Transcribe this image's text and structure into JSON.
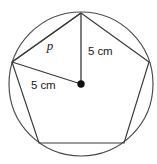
{
  "figure": {
    "background_color": "#ffffff",
    "stroke_color": "#3a3a3a",
    "center_dot_color": "#111111",
    "text_color": "#1a1a1a",
    "labels": {
      "apothem_label": "p",
      "radius_vertical_label": "5 cm",
      "radius_diagonal_label": "5 cm"
    },
    "geometry": {
      "circle": {
        "cx": 81,
        "cy": 84,
        "r": 72
      },
      "center_dot": {
        "cx": 81,
        "cy": 84,
        "r": 3.6
      },
      "pentagon_vertices": [
        {
          "name": "top",
          "x": 81,
          "y": 13
        },
        {
          "name": "right",
          "x": 149,
          "y": 62
        },
        {
          "name": "bottom-right",
          "x": 124,
          "y": 143
        },
        {
          "name": "bottom-left",
          "x": 39,
          "y": 143
        },
        {
          "name": "left",
          "x": 12,
          "y": 62
        }
      ],
      "radius_lines": [
        {
          "name": "vertical-radius",
          "from": "center",
          "to": "top"
        },
        {
          "name": "diagonal-radius",
          "from": "center",
          "to": "left"
        }
      ],
      "chord_lines": [
        {
          "name": "chord-p",
          "from": "left",
          "to": "top"
        }
      ]
    }
  }
}
